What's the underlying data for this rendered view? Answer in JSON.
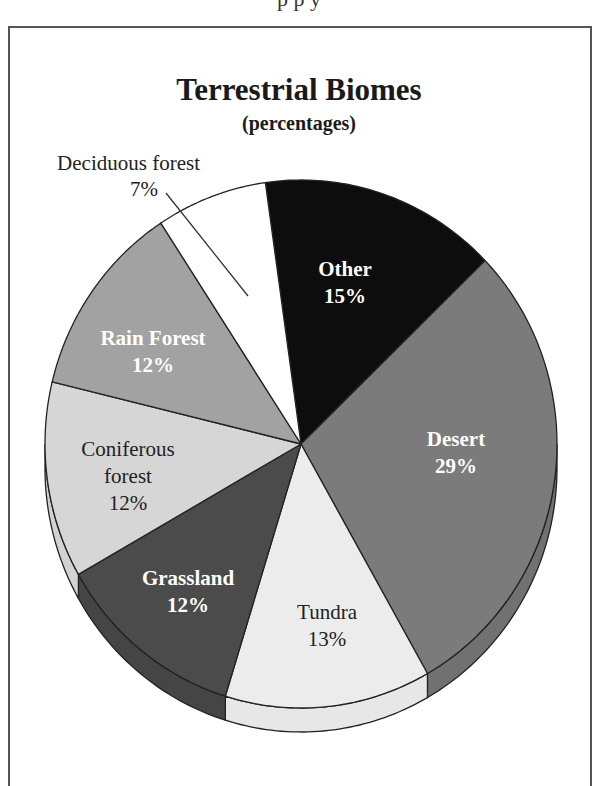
{
  "header_clip": "p p y",
  "chart_data": {
    "type": "pie",
    "style": "3d",
    "title": "Terrestrial Biomes",
    "subtitle": "(percentages)",
    "unit": "%",
    "start_angle_deg": -8,
    "direction": "clockwise",
    "categories": [
      "Other",
      "Desert",
      "Tundra",
      "Grassland",
      "Coniferous forest",
      "Rain Forest",
      "Deciduous forest"
    ],
    "values": [
      15,
      29,
      13,
      12,
      12,
      12,
      7
    ],
    "slices": [
      {
        "name": "Other",
        "value": 15,
        "label": "Other",
        "pct": "15%",
        "color": "#0d0d0d",
        "text_color": "#ffffff",
        "bold": true,
        "lx": 345,
        "ly": 283
      },
      {
        "name": "Desert",
        "value": 29,
        "label": "Desert",
        "pct": "29%",
        "color": "#7b7b7b",
        "text_color": "#ffffff",
        "bold": true,
        "lx": 456,
        "ly": 453
      },
      {
        "name": "Tundra",
        "value": 13,
        "label": "Tundra",
        "pct": "13%",
        "color": "#ececec",
        "text_color": "#222222",
        "bold": false,
        "lx": 327,
        "ly": 626
      },
      {
        "name": "Grassland",
        "value": 12,
        "label": "Grassland",
        "pct": "12%",
        "color": "#4b4b4b",
        "text_color": "#ffffff",
        "bold": true,
        "lx": 188,
        "ly": 592
      },
      {
        "name": "Coniferous forest",
        "value": 12,
        "label": "Coniferous\nforest",
        "pct": "12%",
        "color": "#d6d6d6",
        "text_color": "#222222",
        "bold": false,
        "lx": 128,
        "ly": 476
      },
      {
        "name": "Rain Forest",
        "value": 12,
        "label": "Rain Forest",
        "pct": "12%",
        "color": "#a2a2a2",
        "text_color": "#ffffff",
        "bold": true,
        "lx": 153,
        "ly": 352
      },
      {
        "name": "Deciduous forest",
        "value": 7,
        "label": "Deciduous forest",
        "pct": "7%",
        "color": "#ffffff",
        "text_color": "#222222",
        "bold": false,
        "external": true
      }
    ],
    "external_label": {
      "name": "Deciduous forest",
      "text": "Deciduous forest",
      "pct": "7%"
    },
    "legend": "none",
    "geometry": {
      "cx": 301,
      "cy": 444,
      "rx": 256,
      "ry": 264,
      "depth": 24
    }
  }
}
